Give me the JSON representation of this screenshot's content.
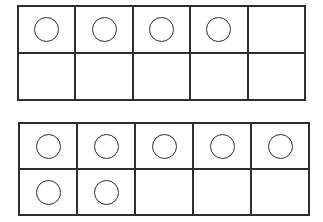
{
  "page": {
    "background_color": "#ffffff",
    "line_color": "#2e2e2e",
    "counter_fill": "none"
  },
  "frames": [
    {
      "name": "ten-frame-top",
      "columns": 5,
      "rows": 2,
      "counter_count": 4,
      "rows_data": [
        {
          "name": "top-row",
          "cells": [
            {
              "filled": true,
              "counter": "circle-counter"
            },
            {
              "filled": true,
              "counter": "circle-counter"
            },
            {
              "filled": true,
              "counter": "circle-counter"
            },
            {
              "filled": true,
              "counter": "circle-counter"
            },
            {
              "filled": false,
              "counter": ""
            }
          ]
        },
        {
          "name": "bottom-row",
          "cells": [
            {
              "filled": false,
              "counter": ""
            },
            {
              "filled": false,
              "counter": ""
            },
            {
              "filled": false,
              "counter": ""
            },
            {
              "filled": false,
              "counter": ""
            },
            {
              "filled": false,
              "counter": ""
            }
          ]
        }
      ]
    },
    {
      "name": "ten-frame-bottom",
      "columns": 5,
      "rows": 2,
      "counter_count": 7,
      "rows_data": [
        {
          "name": "top-row",
          "cells": [
            {
              "filled": true,
              "counter": "circle-counter"
            },
            {
              "filled": true,
              "counter": "circle-counter"
            },
            {
              "filled": true,
              "counter": "circle-counter"
            },
            {
              "filled": true,
              "counter": "circle-counter"
            },
            {
              "filled": true,
              "counter": "circle-counter"
            }
          ]
        },
        {
          "name": "bottom-row",
          "cells": [
            {
              "filled": true,
              "counter": "circle-counter"
            },
            {
              "filled": true,
              "counter": "circle-counter"
            },
            {
              "filled": false,
              "counter": ""
            },
            {
              "filled": false,
              "counter": ""
            },
            {
              "filled": false,
              "counter": ""
            }
          ]
        }
      ]
    }
  ]
}
